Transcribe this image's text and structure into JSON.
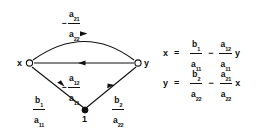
{
  "figure": {
    "type": "signal-flow-graph",
    "nodes": [
      {
        "id": "x",
        "label": "x",
        "shape": "open-circle",
        "x": 29,
        "y": 63
      },
      {
        "id": "y",
        "label": "y",
        "shape": "open-circle",
        "x": 138,
        "y": 63
      },
      {
        "id": "one",
        "label": "1",
        "shape": "filled-dot",
        "x": 85,
        "y": 110
      }
    ],
    "edges": [
      {
        "id": "x-to-y-top",
        "from": "x",
        "to": "y",
        "style": "curved-arc",
        "arrow_direction": "right",
        "label": {
          "sign": "−",
          "numerator": {
            "base": "a",
            "sub": "21"
          },
          "denominator": {
            "base": "a",
            "sub": "22"
          }
        }
      },
      {
        "id": "y-to-x-middle",
        "from": "y",
        "to": "x",
        "style": "straight",
        "arrow_direction": "left",
        "label": {
          "sign": "−",
          "numerator": {
            "base": "a",
            "sub": "12"
          },
          "denominator": {
            "base": "a",
            "sub": "11"
          }
        }
      },
      {
        "id": "one-to-x",
        "from": "one",
        "to": "x",
        "style": "straight",
        "arrow_direction": "down-right",
        "label": {
          "sign": "",
          "numerator": {
            "base": "b",
            "sub": "1"
          },
          "denominator": {
            "base": "a",
            "sub": "11"
          }
        }
      },
      {
        "id": "one-to-y",
        "from": "one",
        "to": "y",
        "style": "straight",
        "arrow_direction": "up-right",
        "label": {
          "sign": "",
          "numerator": {
            "base": "b",
            "sub": "2"
          },
          "denominator": {
            "base": "a",
            "sub": "22"
          }
        }
      }
    ],
    "stroke_color": "#111111",
    "background_color": "#ffffff"
  },
  "equations": [
    {
      "id": "equation-x",
      "lhs": "x",
      "equals": "=",
      "term1": {
        "numerator": {
          "base": "b",
          "sub": "1"
        },
        "denominator": {
          "base": "a",
          "sub": "11"
        }
      },
      "operator": "−",
      "term2": {
        "numerator": {
          "base": "a",
          "sub": "12"
        },
        "denominator": {
          "base": "a",
          "sub": "11"
        }
      },
      "trailing_variable": "y"
    },
    {
      "id": "equation-y",
      "lhs": "y",
      "equals": "=",
      "term1": {
        "numerator": {
          "base": "b",
          "sub": "2"
        },
        "denominator": {
          "base": "a",
          "sub": "22"
        }
      },
      "operator": "−",
      "term2": {
        "numerator": {
          "base": "a",
          "sub": "21"
        },
        "denominator": {
          "base": "a",
          "sub": "22"
        }
      },
      "trailing_variable": "x"
    }
  ]
}
